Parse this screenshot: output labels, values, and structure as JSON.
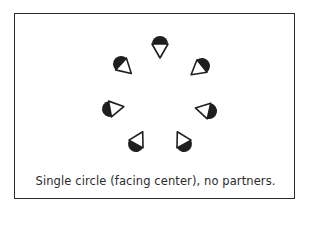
{
  "diagram": {
    "caption": "Single circle (facing center), no partners.",
    "formation": "single circle",
    "facing": "center",
    "center": [
      160,
      100
    ],
    "dancer_count": 7,
    "colors": {
      "fill": "#1e1e1e",
      "stroke": "#1e1e1e",
      "background": "#ffffff"
    },
    "dancers": [
      {
        "id": 1,
        "x": 160,
        "y": 44
      },
      {
        "id": 2,
        "x": 202,
        "y": 66
      },
      {
        "id": 3,
        "x": 209,
        "y": 111
      },
      {
        "id": 4,
        "x": 184,
        "y": 144
      },
      {
        "id": 5,
        "x": 136,
        "y": 144
      },
      {
        "id": 6,
        "x": 110,
        "y": 109
      },
      {
        "id": 7,
        "x": 121,
        "y": 64
      }
    ]
  }
}
